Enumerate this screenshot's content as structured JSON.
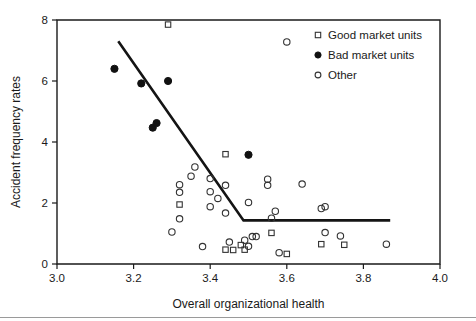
{
  "chart_data": {
    "type": "scatter",
    "title": "",
    "xlabel": "Overall organizational health",
    "ylabel": "Accident frequency rates",
    "xlim": [
      3.0,
      4.0
    ],
    "ylim": [
      0,
      8
    ],
    "xticks": [
      "3.0",
      "3.2",
      "3.4",
      "3.6",
      "3.8",
      "4.0"
    ],
    "xtick_values": [
      3.0,
      3.2,
      3.4,
      3.6,
      3.8,
      4.0
    ],
    "yticks": [
      "0",
      "2",
      "4",
      "6",
      "8"
    ],
    "ytick_values": [
      0,
      2,
      4,
      6,
      8
    ],
    "grid": false,
    "legend_position": "top-right",
    "legend": [
      {
        "label": "Good market units",
        "marker": "open-square"
      },
      {
        "label": "Bad market units",
        "marker": "filled-circle"
      },
      {
        "label": "Other",
        "marker": "open-circle"
      }
    ],
    "series": [
      {
        "name": "Good market units",
        "marker": "open-square",
        "points": [
          [
            3.29,
            7.85
          ],
          [
            3.32,
            1.95
          ],
          [
            3.44,
            3.6
          ],
          [
            3.44,
            0.47
          ],
          [
            3.46,
            0.46
          ],
          [
            3.48,
            0.62
          ],
          [
            3.49,
            0.47
          ],
          [
            3.56,
            1.02
          ],
          [
            3.6,
            0.33
          ],
          [
            3.69,
            0.65
          ],
          [
            3.75,
            0.63
          ]
        ]
      },
      {
        "name": "Bad market units",
        "marker": "filled-circle",
        "points": [
          [
            3.15,
            6.4
          ],
          [
            3.22,
            5.92
          ],
          [
            3.25,
            4.47
          ],
          [
            3.26,
            4.62
          ],
          [
            3.29,
            6.0
          ],
          [
            3.5,
            3.58
          ]
        ]
      },
      {
        "name": "Other",
        "marker": "open-circle",
        "points": [
          [
            3.3,
            1.05
          ],
          [
            3.32,
            2.6
          ],
          [
            3.32,
            2.35
          ],
          [
            3.32,
            1.48
          ],
          [
            3.36,
            3.18
          ],
          [
            3.35,
            2.88
          ],
          [
            3.38,
            0.57
          ],
          [
            3.4,
            2.8
          ],
          [
            3.4,
            2.37
          ],
          [
            3.4,
            1.88
          ],
          [
            3.42,
            2.15
          ],
          [
            3.44,
            2.58
          ],
          [
            3.44,
            1.67
          ],
          [
            3.45,
            0.72
          ],
          [
            3.49,
            0.78
          ],
          [
            3.5,
            0.58
          ],
          [
            3.5,
            2.02
          ],
          [
            3.51,
            0.9
          ],
          [
            3.52,
            0.9
          ],
          [
            3.55,
            2.78
          ],
          [
            3.55,
            2.58
          ],
          [
            3.56,
            1.5
          ],
          [
            3.57,
            1.73
          ],
          [
            3.58,
            0.37
          ],
          [
            3.6,
            7.28
          ],
          [
            3.64,
            2.62
          ],
          [
            3.69,
            1.82
          ],
          [
            3.7,
            1.88
          ],
          [
            3.7,
            1.03
          ],
          [
            3.74,
            0.92
          ],
          [
            3.86,
            0.65
          ]
        ]
      }
    ],
    "fit_line": {
      "type": "piecewise-linear",
      "points": [
        [
          3.16,
          7.3
        ],
        [
          3.487,
          1.43
        ],
        [
          3.87,
          1.43
        ]
      ]
    }
  }
}
